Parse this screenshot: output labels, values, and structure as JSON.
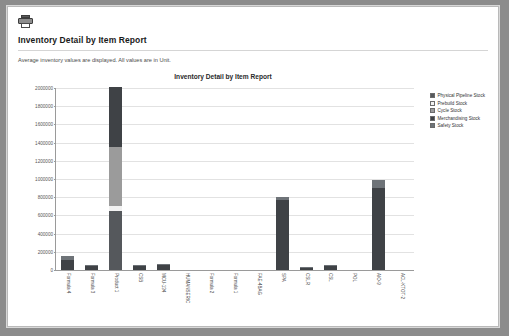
{
  "report": {
    "icon": "printer-icon",
    "title": "Inventory Detail by Item Report",
    "subtitle": "Average inventory values are displayed. All values are in Unit."
  },
  "colors": {
    "physical_pipeline": "#55585c",
    "prebuild": "#f2f2f2",
    "cycle": "#9b9b9b",
    "merchandising": "#3f4246",
    "safety": "#6e7378",
    "grid": "#e2e2e2",
    "axis": "#9a9a9a"
  },
  "chart_data": {
    "type": "bar",
    "title": "Inventory Detail by Item Report",
    "xlabel": "",
    "ylabel": "",
    "ylim": [
      0,
      2000000
    ],
    "grid": true,
    "stacked": true,
    "legend_position": "right",
    "yticks": [
      2000000,
      1800000,
      1600000,
      1400000,
      1200000,
      1000000,
      800000,
      600000,
      400000,
      200000,
      0
    ],
    "ytick_labels": [
      "2000000",
      "1800000",
      "1600000",
      "1400000",
      "1200000",
      "1000000",
      "800000",
      "600000",
      "400000",
      "200000",
      "0"
    ],
    "categories": [
      "Formula 4",
      "Formula 3",
      "Product 1",
      "CSB",
      "MCU-134",
      "HUMANSERIC",
      "Formula 2",
      "Formula 1",
      "FAE-4BAG",
      "SPA",
      "CSLR",
      "CSL",
      "POL",
      "AIO-9",
      "ACL-KTOT-2"
    ],
    "series": [
      {
        "name": "Physical Pipeline Stock",
        "color": "#55585c",
        "values": [
          0,
          0,
          650000,
          0,
          0,
          0,
          0,
          0,
          0,
          0,
          0,
          0,
          0,
          0,
          0
        ]
      },
      {
        "name": "Prebuild Stock",
        "color": "#f2f2f2",
        "values": [
          0,
          0,
          55000,
          0,
          0,
          0,
          0,
          0,
          0,
          0,
          0,
          0,
          0,
          0,
          0
        ]
      },
      {
        "name": "Cycle Stock",
        "color": "#9b9b9b",
        "values": [
          0,
          0,
          640000,
          0,
          0,
          0,
          0,
          0,
          0,
          0,
          0,
          0,
          0,
          0,
          0
        ]
      },
      {
        "name": "Merchandising Stock",
        "color": "#3f4246",
        "values": [
          110000,
          40000,
          655000,
          45000,
          55000,
          0,
          0,
          0,
          0,
          760000,
          20000,
          45000,
          0,
          900000,
          0
        ]
      },
      {
        "name": "Safety Stock",
        "color": "#6e7378",
        "values": [
          40000,
          10000,
          0,
          12000,
          10000,
          0,
          0,
          0,
          0,
          40000,
          8000,
          12000,
          0,
          80000,
          0
        ]
      }
    ]
  }
}
